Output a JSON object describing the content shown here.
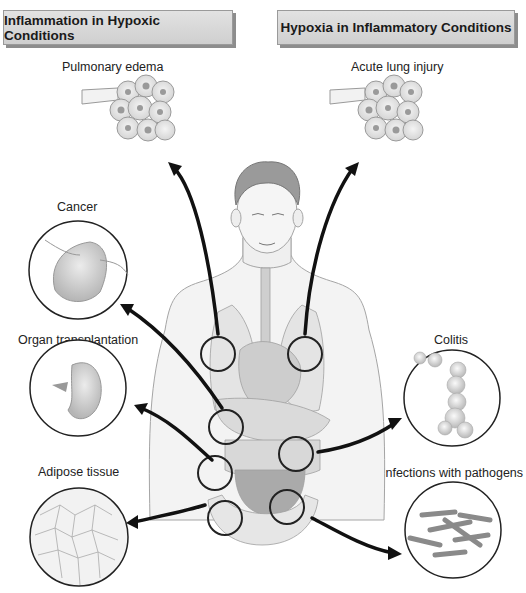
{
  "header": {
    "left_title": "Inflammation in Hypoxic Conditions",
    "right_title": "Hypoxia in Inflammatory Conditions"
  },
  "conditions": {
    "pulmonary_edema": "Pulmonary edema",
    "acute_lung_injury": "Acute lung injury",
    "cancer": "Cancer",
    "organ_transplantation": "Organ transplantation",
    "adipose_tissue": "Adipose tissue",
    "colitis": "Colitis",
    "infections": "Infections with pathogens"
  },
  "colors": {
    "banner_bg": "#d6d6d6",
    "banner_shadow": "#8d8d8d",
    "arrow": "#111111",
    "organ_fill": "#c8c8c8",
    "body_outline": "#9a9a9a"
  }
}
